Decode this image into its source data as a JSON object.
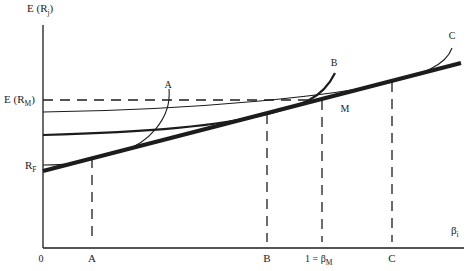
{
  "figure": {
    "y_axis_label": {
      "main": "E (R",
      "sub": "j",
      "close": ")"
    },
    "x_axis_label": {
      "main": "β",
      "sub": "i"
    },
    "origin_label": "0",
    "y_ticks": {
      "expected_market_return": {
        "main": "E (R",
        "sub": "M",
        "close": ")"
      },
      "risk_free": {
        "main": "R",
        "sub": "F"
      }
    },
    "x_ticks": {
      "a": "A",
      "b": "B",
      "beta_m": {
        "main": "1 = β",
        "sub": "M"
      },
      "c": "C"
    },
    "curve_labels": {
      "a": "A",
      "b": "B",
      "c": "C"
    },
    "point_labels": {
      "m": "M"
    },
    "elements": [
      "security market line (thick straight line from R_F)",
      "curve A tangent near beta A",
      "curve B tangent near beta B",
      "curve C tangent near beta C",
      "dashed guide E(R_M) to point M",
      "dashed verticals at A, B, 1 = beta_M, C"
    ]
  },
  "colors": {
    "ink": "#1c1c1c",
    "background": "#ffffff"
  }
}
